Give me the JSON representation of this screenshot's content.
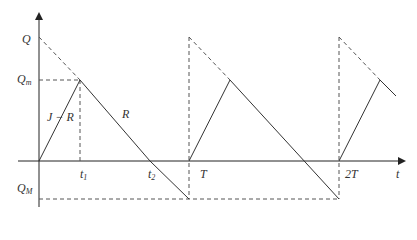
{
  "diagram": {
    "axes": {
      "x_label": "t",
      "y_label_top": "Q",
      "y_label_mid": "Q",
      "y_label_mid_sub": "m",
      "y_label_bottom": "Q",
      "y_label_bottom_sub": "M"
    },
    "time_labels": {
      "t1": "t",
      "t1_sub": "1",
      "t2": "t",
      "t2_sub": "2",
      "T": "T",
      "two_T": "2T"
    },
    "slope_labels": {
      "rising": "J − R",
      "falling": "R"
    },
    "colors": {
      "line": "#333333",
      "dashed": "#555555",
      "background": "#ffffff"
    }
  }
}
